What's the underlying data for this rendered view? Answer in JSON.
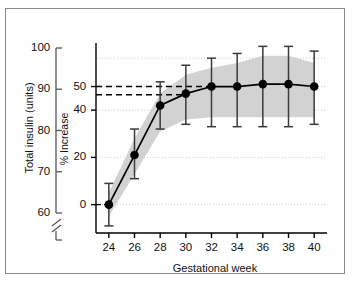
{
  "figure": {
    "background": "#ffffff",
    "border_color": "#8a8a8a"
  },
  "chart_data": {
    "type": "line",
    "title": "",
    "xlabel": "Gestational week",
    "ylabel": "% Increase",
    "secondary_ylabel": "Total insulin (units)",
    "x": [
      24,
      26,
      28,
      30,
      32,
      34,
      36,
      38,
      40
    ],
    "series": [
      {
        "name": "% increase in total insulin dose",
        "values": [
          0,
          21,
          42,
          47,
          50,
          50,
          51,
          51,
          50
        ],
        "err_low": [
          -9,
          11,
          32,
          34,
          33,
          33,
          33,
          33,
          34
        ],
        "err_high": [
          9,
          32,
          52,
          59,
          62,
          64,
          67,
          67,
          65
        ],
        "marker": "filled-circle",
        "color": "#000000"
      }
    ],
    "band": {
      "name": "shaded interquartile band",
      "color": "#d2d2d2",
      "lower": [
        -5,
        13,
        31,
        36,
        37,
        37,
        37,
        37,
        37
      ],
      "upper": [
        5,
        28,
        47,
        55,
        58,
        60,
        63,
        63,
        60
      ]
    },
    "reference_lines": [
      {
        "name": "upper-dashed-reference",
        "value": 50,
        "style": "dashed"
      },
      {
        "name": "lower-dashed-reference",
        "value": 46.5,
        "style": "dashed"
      },
      {
        "name": "baseline-dashed-left",
        "value": 0,
        "style": "dashed"
      }
    ],
    "xlim": [
      23,
      41
    ],
    "ylim": [
      -12,
      68
    ],
    "yticks": [
      0,
      20,
      40,
      50
    ],
    "ytick_labels": [
      "0",
      "20",
      "40",
      "50"
    ],
    "xticks": [
      24,
      26,
      28,
      30,
      32,
      34,
      36,
      38,
      40
    ],
    "xtick_labels": [
      "24",
      "26",
      "28",
      "30",
      "32",
      "34",
      "36",
      "38",
      "40"
    ],
    "secondary_yticks": [
      60,
      70,
      80,
      90,
      100
    ],
    "secondary_ytick_labels": [
      "60",
      "70",
      "80",
      "90",
      "100"
    ],
    "secondary_axis_break": true,
    "grid": "dotted-horizontal",
    "legend": "none"
  },
  "labels": {
    "y_left_title": "Total insulin (units)",
    "y_right_title": "% Increase",
    "x_title": "Gestational week",
    "left_ticks": [
      "100",
      "90",
      "80",
      "70",
      "60"
    ],
    "inner_ticks": [
      "50",
      "40",
      "20",
      "0"
    ],
    "x_ticks": [
      "24",
      "26",
      "28",
      "30",
      "32",
      "34",
      "36",
      "38",
      "40"
    ]
  }
}
